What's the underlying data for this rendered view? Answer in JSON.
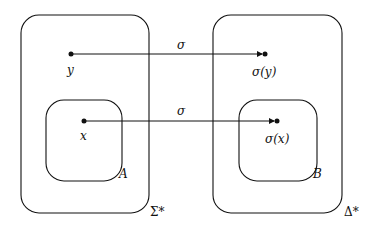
{
  "diagram": {
    "type": "set-mapping",
    "domain_set": {
      "outer_label": "Σ*",
      "subset_label": "A",
      "points": [
        {
          "name": "y",
          "label": "y"
        },
        {
          "name": "x",
          "label": "x"
        }
      ]
    },
    "codomain_set": {
      "outer_label": "Δ*",
      "subset_label": "B",
      "points": [
        {
          "name": "sigma-y",
          "label": "σ(y)"
        },
        {
          "name": "sigma-x",
          "label": "σ(x)"
        }
      ]
    },
    "arrows": [
      {
        "from": "y",
        "to": "σ(y)",
        "label": "σ"
      },
      {
        "from": "x",
        "to": "σ(x)",
        "label": "σ"
      }
    ],
    "colors": {
      "stroke": "#111111",
      "background": "#ffffff"
    }
  }
}
